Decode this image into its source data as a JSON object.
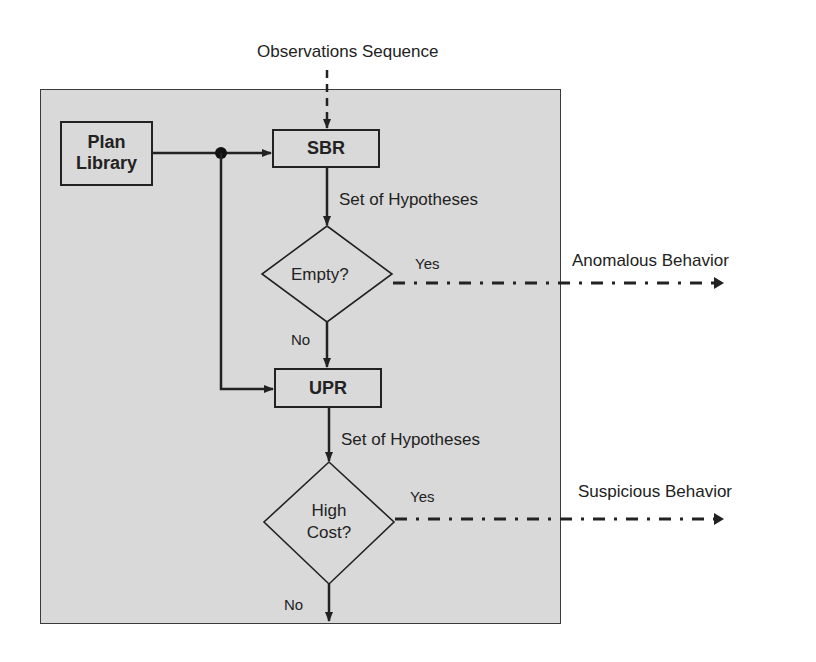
{
  "diagram": {
    "input_label": "Observations Sequence",
    "nodes": {
      "plan_library": {
        "line1": "Plan",
        "line2": "Library"
      },
      "sbr": {
        "label": "SBR"
      },
      "empty_decision": {
        "label": "Empty?"
      },
      "upr": {
        "label": "UPR"
      },
      "high_cost_decision": {
        "line1": "High",
        "line2": "Cost?"
      }
    },
    "edges": {
      "sbr_output": "Set of Hypotheses",
      "upr_output": "Set of Hypotheses",
      "empty_yes": "Yes",
      "empty_no": "No",
      "high_cost_yes": "Yes",
      "high_cost_no": "No"
    },
    "outputs": {
      "anomalous": "Anomalous Behavior",
      "suspicious": "Suspicious Behavior"
    },
    "colors": {
      "panel_fill": "#d9d9d9",
      "stroke": "#222222",
      "background": "#ffffff"
    }
  }
}
